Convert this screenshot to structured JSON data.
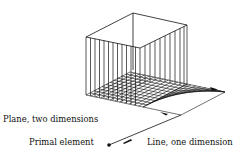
{
  "diagram": {
    "labels": {
      "plane": "Plane, two dimensions",
      "primal": "Primal element",
      "line": "Line, one dimension"
    },
    "icons": [
      "dot-icon",
      "arrow-icon"
    ],
    "colors": {
      "stroke": "#111111",
      "background": "#ffffff"
    }
  }
}
